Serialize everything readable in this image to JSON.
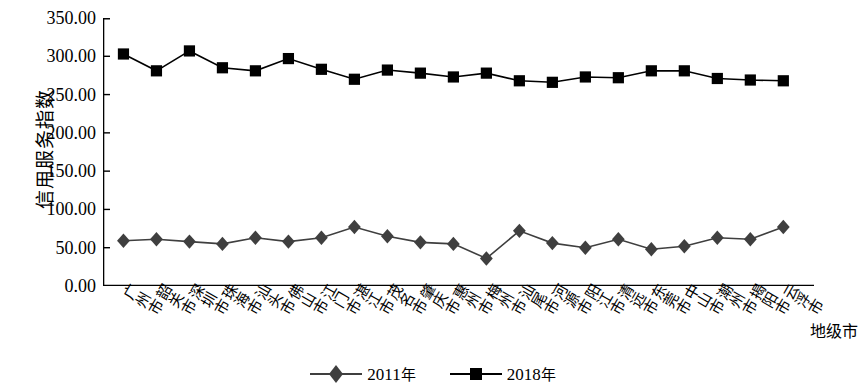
{
  "chart_data": {
    "type": "line",
    "title": "",
    "xlabel": "地级市",
    "ylabel": "信用服务指数",
    "ylim": [
      0,
      350
    ],
    "ytick_step": 50,
    "ytick_labels": [
      "0.00",
      "50.00",
      "100.00",
      "150.00",
      "200.00",
      "250.00",
      "300.00",
      "350.00"
    ],
    "grid": false,
    "legend_position": "bottom-center",
    "categories": [
      "广州市",
      "韶关市",
      "深圳市",
      "珠海市",
      "汕头市",
      "佛山市",
      "江门市",
      "湛江市",
      "茂名市",
      "肇庆市",
      "惠州市",
      "梅州市",
      "汕尾市",
      "河源市",
      "阳江市",
      "清远市",
      "东莞市",
      "中山市",
      "潮州市",
      "揭阳市",
      "云浮市"
    ],
    "series": [
      {
        "name": "2011年",
        "marker": "diamond",
        "color": "#3f3f3f",
        "values": [
          59,
          61,
          58,
          55,
          63,
          58,
          63,
          77,
          65,
          57,
          55,
          36,
          72,
          56,
          50,
          61,
          48,
          52,
          63,
          61,
          77
        ]
      },
      {
        "name": "2018年",
        "marker": "square",
        "color": "#000000",
        "values": [
          303,
          281,
          307,
          285,
          281,
          297,
          283,
          270,
          282,
          278,
          273,
          278,
          268,
          266,
          273,
          272,
          281,
          281,
          271,
          269,
          268
        ]
      }
    ]
  },
  "axis": {
    "y_title": "信用服务指数",
    "x_title": "地级市"
  },
  "legend": {
    "items": [
      {
        "label": "2011年",
        "marker": "diamond-marker"
      },
      {
        "label": "2018年",
        "marker": "square-marker"
      }
    ]
  }
}
